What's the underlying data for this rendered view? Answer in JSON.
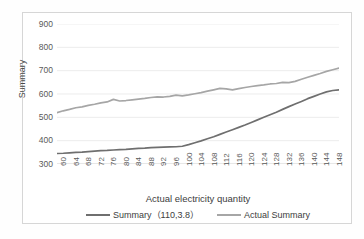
{
  "chart_data": {
    "type": "line",
    "title": "",
    "xlabel": "Actual electricity quantity",
    "ylabel": "Summary",
    "ylim": [
      300,
      900
    ],
    "yticks": [
      300,
      400,
      500,
      600,
      700,
      800,
      900
    ],
    "xlim": [
      60,
      150
    ],
    "xticks": [
      60,
      64,
      68,
      72,
      76,
      80,
      84,
      88,
      92,
      96,
      100,
      104,
      108,
      112,
      116,
      120,
      124,
      128,
      132,
      136,
      140,
      144,
      148
    ],
    "grid": "horizontal",
    "legend_position": "bottom",
    "x": [
      60,
      62,
      64,
      66,
      68,
      70,
      72,
      74,
      76,
      78,
      80,
      82,
      84,
      86,
      88,
      90,
      92,
      94,
      96,
      98,
      100,
      102,
      104,
      106,
      108,
      110,
      112,
      114,
      116,
      118,
      120,
      122,
      124,
      126,
      128,
      130,
      132,
      134,
      136,
      138,
      140,
      142,
      144,
      146,
      148,
      150
    ],
    "series": [
      {
        "name": "Summary（110,3.8）",
        "color": "#6f6f6f",
        "values": [
          345,
          346,
          348,
          350,
          351,
          353,
          355,
          357,
          358,
          360,
          362,
          363,
          365,
          367,
          368,
          370,
          371,
          372,
          373,
          374,
          376,
          383,
          391,
          399,
          408,
          417,
          427,
          437,
          447,
          457,
          467,
          478,
          489,
          500,
          511,
          522,
          534,
          546,
          557,
          568,
          580,
          590,
          600,
          609,
          615,
          618
        ]
      },
      {
        "name": "Actual Summary",
        "color": "#a6a6a6",
        "values": [
          520,
          528,
          534,
          541,
          545,
          551,
          556,
          562,
          566,
          577,
          570,
          572,
          575,
          578,
          581,
          585,
          588,
          587,
          590,
          595,
          592,
          596,
          601,
          606,
          612,
          618,
          624,
          622,
          618,
          623,
          628,
          632,
          636,
          639,
          643,
          645,
          650,
          649,
          654,
          663,
          672,
          680,
          688,
          697,
          704,
          711
        ]
      }
    ]
  },
  "legend": {
    "items": [
      {
        "label": "Summary（110,3.8）",
        "color": "#6f6f6f"
      },
      {
        "label": "Actual Summary",
        "color": "#a6a6a6"
      }
    ]
  },
  "axes": {
    "y_title": "Summary",
    "x_title": "Actual electricity quantity"
  }
}
